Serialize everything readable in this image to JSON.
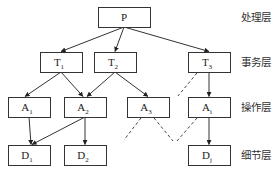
{
  "diagram": {
    "type": "hierarchy",
    "nodes": [
      {
        "id": "P",
        "label": "P",
        "sub": ""
      },
      {
        "id": "T1",
        "label": "T",
        "sub": "1"
      },
      {
        "id": "T2",
        "label": "T",
        "sub": "2"
      },
      {
        "id": "T3",
        "label": "T",
        "sub": "3"
      },
      {
        "id": "A1",
        "label": "A",
        "sub": "1"
      },
      {
        "id": "A2",
        "label": "A",
        "sub": "2"
      },
      {
        "id": "A3",
        "label": "A",
        "sub": "3"
      },
      {
        "id": "Ai",
        "label": "A",
        "sub": "i"
      },
      {
        "id": "D1",
        "label": "D",
        "sub": "1"
      },
      {
        "id": "D2",
        "label": "D",
        "sub": "2"
      },
      {
        "id": "Dj",
        "label": "D",
        "sub": "j"
      }
    ],
    "edges": [
      {
        "from": "P",
        "to": "T1",
        "style": "solid"
      },
      {
        "from": "P",
        "to": "T2",
        "style": "solid"
      },
      {
        "from": "P",
        "to": "T3",
        "style": "solid"
      },
      {
        "from": "T1",
        "to": "A1",
        "style": "solid"
      },
      {
        "from": "T1",
        "to": "A2",
        "style": "solid"
      },
      {
        "from": "T2",
        "to": "A2",
        "style": "solid"
      },
      {
        "from": "T2",
        "to": "A3",
        "style": "solid"
      },
      {
        "from": "T3",
        "to": "Ai",
        "style": "solid"
      },
      {
        "from": "A1",
        "to": "D1",
        "style": "solid"
      },
      {
        "from": "A2",
        "to": "D1",
        "style": "solid"
      },
      {
        "from": "A2",
        "to": "D2",
        "style": "solid"
      },
      {
        "from": "Ai",
        "to": "Dj",
        "style": "solid"
      }
    ],
    "ellipsis_links": "dashed lines indicating omitted intermediate nodes",
    "layers": [
      {
        "name": "处理层"
      },
      {
        "name": "事务层"
      },
      {
        "name": "操作层"
      },
      {
        "name": "细节层"
      }
    ]
  }
}
